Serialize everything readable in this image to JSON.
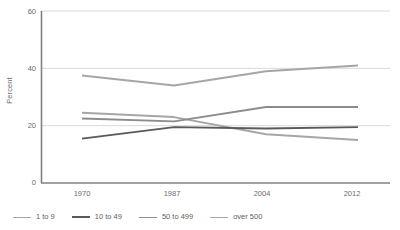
{
  "chart_data": {
    "type": "line",
    "title": "",
    "xlabel": "",
    "ylabel": "Percent",
    "categories": [
      "1970",
      "1987",
      "2004",
      "2012"
    ],
    "ylim": [
      0,
      60
    ],
    "yticks": [
      0,
      20,
      40,
      60
    ],
    "grid": true,
    "legend_position": "bottom",
    "series": [
      {
        "name": "1 to 9",
        "color": "#a6a6a6",
        "values": [
          24.5,
          23.0,
          17.0,
          15.0
        ]
      },
      {
        "name": "10 to 49",
        "color": "#595959",
        "values": [
          15.5,
          19.5,
          19.0,
          19.5
        ]
      },
      {
        "name": "50 to 499",
        "color": "#8c8c8c",
        "values": [
          22.5,
          21.5,
          26.5,
          26.5
        ]
      },
      {
        "name": "over 500",
        "color": "#a6a6a6",
        "values": [
          37.5,
          34.0,
          39.0,
          41.0
        ]
      }
    ]
  },
  "axis": {
    "y_label": "Percent",
    "y_ticks": [
      "60",
      "40",
      "20",
      "0"
    ],
    "x_ticks": [
      "1970",
      "1987",
      "2004",
      "2012"
    ]
  },
  "legend": {
    "items": [
      {
        "label": "1 to 9"
      },
      {
        "label": "10 to 49"
      },
      {
        "label": "50 to 499"
      },
      {
        "label": "over 500"
      }
    ]
  },
  "colors": {
    "axis_line": "#808080",
    "grid_line": "#d9d9d9",
    "tick_text": "#6b6b6b",
    "series_light": "#a6a6a6",
    "series_dark": "#595959",
    "series_medium": "#8c8c8c",
    "background": "#ffffff"
  }
}
